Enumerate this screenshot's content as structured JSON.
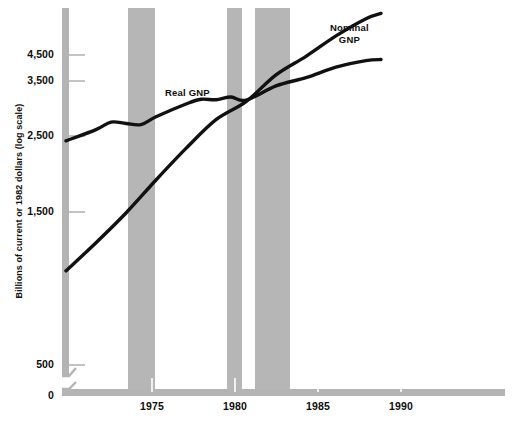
{
  "chart_data": {
    "type": "line",
    "title": "",
    "subtitle": "",
    "xlabel": "",
    "ylabel": "Billions of current or 1982 dollars (log scale)",
    "y_scale": "log",
    "y_axis_break": true,
    "y_ticks": [
      {
        "label": "4,500",
        "value": 4500,
        "y": 55
      },
      {
        "label": "3,500",
        "value": 3500,
        "y": 81
      },
      {
        "label": "2,500",
        "value": 2500,
        "y": 136
      },
      {
        "label": "1,500",
        "value": 1500,
        "y": 212
      },
      {
        "label": "500",
        "value": 500,
        "y": 365
      },
      {
        "label": "0",
        "value": 0,
        "y": 396
      }
    ],
    "x_ticks": [
      {
        "label": "1975",
        "value": 1975,
        "x": 152
      },
      {
        "label": "1980",
        "value": 1980,
        "x": 235
      },
      {
        "label": "1985",
        "value": 1985,
        "x": 318
      },
      {
        "label": "1990",
        "value": 1990,
        "x": 401
      }
    ],
    "xlim": [
      1970,
      1992
    ],
    "grid": false,
    "legend": "inline-annotations",
    "series": [
      {
        "name": "Nominal GNP",
        "color": "#111111",
        "label_x": 330,
        "label_y": 22,
        "label_text": "Nominal\nGNP",
        "points": [
          {
            "x": 1970,
            "y": 1010
          },
          {
            "x": 1972,
            "y": 1220
          },
          {
            "x": 1974,
            "y": 1490
          },
          {
            "x": 1976,
            "y": 1860
          },
          {
            "x": 1978,
            "y": 2300
          },
          {
            "x": 1980,
            "y": 2790
          },
          {
            "x": 1982,
            "y": 3150
          },
          {
            "x": 1984,
            "y": 3770
          },
          {
            "x": 1986,
            "y": 4270
          },
          {
            "x": 1988,
            "y": 4900
          },
          {
            "x": 1990,
            "y": 5500
          },
          {
            "x": 1991,
            "y": 5700
          }
        ]
      },
      {
        "name": "Real GNP",
        "color": "#111111",
        "label_x": 165,
        "label_y": 87,
        "label_text": "Real GNP",
        "points": [
          {
            "x": 1970,
            "y": 2420
          },
          {
            "x": 1972,
            "y": 2610
          },
          {
            "x": 1973,
            "y": 2745
          },
          {
            "x": 1974,
            "y": 2720
          },
          {
            "x": 1975,
            "y": 2700
          },
          {
            "x": 1976,
            "y": 2845
          },
          {
            "x": 1978,
            "y": 3100
          },
          {
            "x": 1979,
            "y": 3200
          },
          {
            "x": 1980,
            "y": 3190
          },
          {
            "x": 1981,
            "y": 3250
          },
          {
            "x": 1982,
            "y": 3180
          },
          {
            "x": 1984,
            "y": 3500
          },
          {
            "x": 1986,
            "y": 3700
          },
          {
            "x": 1988,
            "y": 3970
          },
          {
            "x": 1990,
            "y": 4150
          },
          {
            "x": 1991,
            "y": 4180
          }
        ]
      }
    ],
    "recession_bands": [
      {
        "name": "recession-1973-1975",
        "x_start": 1973.6,
        "x_end": 1975.2,
        "px_start": 128,
        "px_end": 155
      },
      {
        "name": "recession-1980",
        "x_start": 1979.5,
        "x_end": 1980.4,
        "px_start": 227,
        "px_end": 242
      },
      {
        "name": "recession-1981-1982",
        "x_start": 1981.2,
        "x_end": 1983.3,
        "px_start": 255,
        "px_end": 290
      }
    ],
    "colors": {
      "band": "#b6b6b6",
      "axis": "#b4b4b4",
      "line": "#111111",
      "text": "#0d0d0d",
      "background": "#ffffff"
    }
  }
}
